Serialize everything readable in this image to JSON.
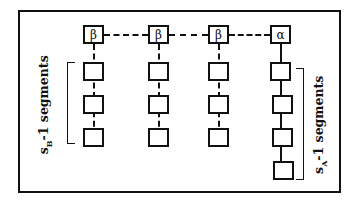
{
  "diagram": {
    "top_row": [
      {
        "label": "β",
        "type": "beta"
      },
      {
        "label": "β",
        "type": "beta"
      },
      {
        "label": "β",
        "type": "beta"
      },
      {
        "label": "α",
        "type": "alpha"
      }
    ],
    "beta_segment_count": 3,
    "alpha_segment_count": 4,
    "left_label": {
      "prefix": "s",
      "subscript": "B",
      "suffix": "-1  segments"
    },
    "right_label": {
      "prefix": "s",
      "subscript": "A",
      "suffix": "-1  segments"
    },
    "colors": {
      "line": "#111111",
      "background": "#ffffff"
    }
  }
}
